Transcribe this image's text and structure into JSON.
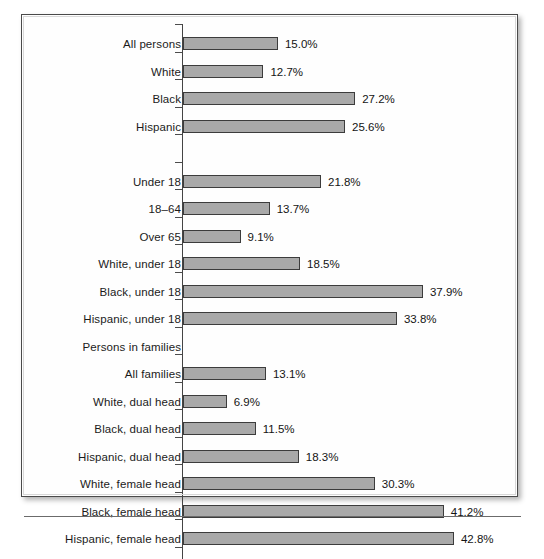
{
  "figure": {
    "frame_color": "#4a4a4a",
    "background_color": "#fefefe",
    "bar_fill_color": "#a9a9a9",
    "bar_border_color": "#3c3c3c",
    "axis_color": "#444444"
  },
  "chart_data": {
    "type": "bar",
    "orientation": "horizontal",
    "title": "",
    "subtitle": "",
    "xlabel": "",
    "ylabel": "",
    "grid": false,
    "legend": null,
    "value_suffix": "%",
    "xlim": [
      0,
      42.8
    ],
    "px_per_unit": 6.33,
    "categories": [
      "All persons",
      "White",
      "Black",
      "Hispanic",
      "",
      "Under 18",
      "18–64",
      "Over 65",
      "White, under 18",
      "Black, under 18",
      "Hispanic, under 18",
      "Persons in families",
      "All families",
      "White, dual head",
      "Black, dual head",
      "Hispanic, dual head",
      "White, female head",
      "Black, female head",
      "Hispanic, female head"
    ],
    "values": [
      15.0,
      12.7,
      27.2,
      25.6,
      null,
      21.8,
      13.7,
      9.1,
      18.5,
      37.9,
      33.8,
      null,
      13.1,
      6.9,
      11.5,
      18.3,
      30.3,
      41.2,
      42.8
    ],
    "value_labels": [
      "15.0%",
      "12.7%",
      "27.2%",
      "25.6%",
      "",
      "21.8%",
      "13.7%",
      "9.1%",
      "18.5%",
      "37.9%",
      "33.8%",
      "",
      "13.1%",
      "6.9%",
      "11.5%",
      "18.3%",
      "30.3%",
      "41.2%",
      "42.8%"
    ],
    "rows": [
      {
        "label": "All persons",
        "value": 15.0,
        "value_label": "15.0%",
        "has_bar": true
      },
      {
        "label": "White",
        "value": 12.7,
        "value_label": "12.7%",
        "has_bar": true
      },
      {
        "label": "Black",
        "value": 27.2,
        "value_label": "27.2%",
        "has_bar": true
      },
      {
        "label": "Hispanic",
        "value": 25.6,
        "value_label": "25.6%",
        "has_bar": true
      },
      {
        "label": "",
        "value": null,
        "value_label": "",
        "has_bar": false
      },
      {
        "label": "Under 18",
        "value": 21.8,
        "value_label": "21.8%",
        "has_bar": true
      },
      {
        "label": "18–64",
        "value": 13.7,
        "value_label": "13.7%",
        "has_bar": true
      },
      {
        "label": "Over 65",
        "value": 9.1,
        "value_label": "9.1%",
        "has_bar": true
      },
      {
        "label": "White, under 18",
        "value": 18.5,
        "value_label": "18.5%",
        "has_bar": true
      },
      {
        "label": "Black, under 18",
        "value": 37.9,
        "value_label": "37.9%",
        "has_bar": true
      },
      {
        "label": "Hispanic, under 18",
        "value": 33.8,
        "value_label": "33.8%",
        "has_bar": true
      },
      {
        "label": "Persons in families",
        "value": null,
        "value_label": "",
        "has_bar": false
      },
      {
        "label": "All families",
        "value": 13.1,
        "value_label": "13.1%",
        "has_bar": true
      },
      {
        "label": "White, dual head",
        "value": 6.9,
        "value_label": "6.9%",
        "has_bar": true
      },
      {
        "label": "Black, dual head",
        "value": 11.5,
        "value_label": "11.5%",
        "has_bar": true
      },
      {
        "label": "Hispanic, dual head",
        "value": 18.3,
        "value_label": "18.3%",
        "has_bar": true
      },
      {
        "label": "White, female head",
        "value": 30.3,
        "value_label": "30.3%",
        "has_bar": true
      },
      {
        "label": "Black, female head",
        "value": 41.2,
        "value_label": "41.2%",
        "has_bar": true
      },
      {
        "label": "Hispanic, female head",
        "value": 42.8,
        "value_label": "42.8%",
        "has_bar": true
      }
    ]
  }
}
